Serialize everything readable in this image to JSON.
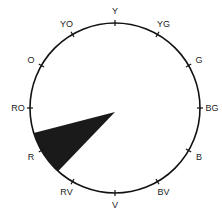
{
  "diagram": {
    "type": "color-wheel",
    "center": [
      115,
      108
    ],
    "radius": 85,
    "stroke_color": "#111111",
    "wedge_color": "#1a1a1a",
    "hues": [
      {
        "label": "Y",
        "angle": 90
      },
      {
        "label": "YG",
        "angle": 60
      },
      {
        "label": "G",
        "angle": 30
      },
      {
        "label": "BG",
        "angle": 0
      },
      {
        "label": "B",
        "angle": -30
      },
      {
        "label": "BV",
        "angle": -60
      },
      {
        "label": "V",
        "angle": -90
      },
      {
        "label": "RV",
        "angle": -120
      },
      {
        "label": "R",
        "angle": -150
      },
      {
        "label": "RO",
        "angle": 180
      },
      {
        "label": "O",
        "angle": 150
      },
      {
        "label": "YO",
        "angle": 120
      }
    ],
    "highlighted_wedge": {
      "hue": "R",
      "apex": [
        115,
        112
      ],
      "start_angle": -163,
      "end_angle": -132
    }
  }
}
